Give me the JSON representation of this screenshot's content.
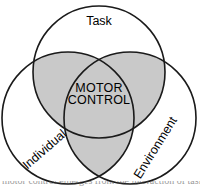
{
  "figure": {
    "type": "venn-diagram",
    "circle_count": 3,
    "center_label_line1": "MOTOR",
    "center_label_line2": "CONTROL",
    "circles": [
      {
        "id": "task",
        "label": "Task",
        "cx": 99,
        "cy": 72,
        "r": 66,
        "label_x": 99,
        "label_y": 22,
        "rotation": 0
      },
      {
        "id": "individual",
        "label": "Individual",
        "cx": 68,
        "cy": 118,
        "r": 66,
        "label_x": 45,
        "label_y": 150,
        "rotation": -41
      },
      {
        "id": "environment",
        "label": "Environment",
        "cx": 130,
        "cy": 118,
        "r": 66,
        "label_x": 156,
        "label_y": 148,
        "rotation": -58
      }
    ],
    "colors": {
      "fill_shaded": "#c9c9c9",
      "fill_unshaded": "#ffffff",
      "stroke": "#1a1a1a",
      "text": "#000000",
      "background": "#ffffff"
    },
    "shading_note": "pairwise-intersections-shaded"
  },
  "caption": {
    "text": "motor control emerges from the interaction of task, individual and environment"
  }
}
